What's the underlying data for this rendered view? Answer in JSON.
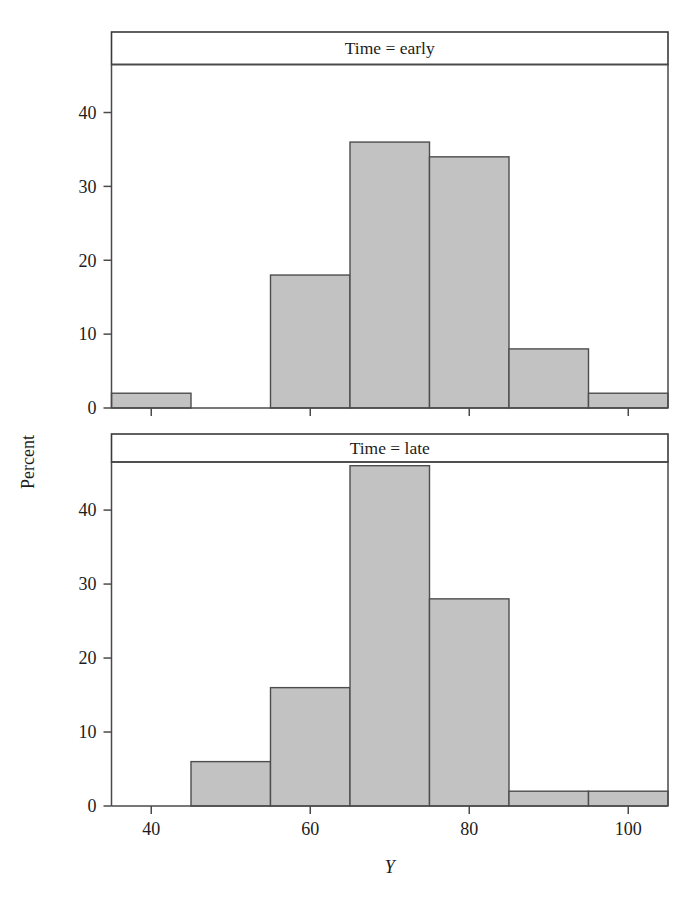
{
  "figure": {
    "width": 691,
    "height": 908,
    "background": "#ffffff",
    "bar_fill": "#c2c2c2",
    "bar_stroke": "#4d4d4d",
    "frame_stroke": "#4a4a4a",
    "text_color": "#1c1c1c"
  },
  "axes": {
    "y_label": "Percent",
    "x_label": "Y",
    "x_label_style": "italic"
  },
  "chart_data": {
    "type": "bar",
    "title": "",
    "xlabel": "Y",
    "ylabel": "Percent",
    "grid": false,
    "legend": "none",
    "layout": "two stacked panels (conditioned on Time)",
    "bin_width": 10,
    "xlim": [
      35,
      105
    ],
    "x_ticks": [
      40,
      60,
      80,
      100
    ],
    "x_tick_labels": [
      "40",
      "60",
      "80",
      "100"
    ],
    "panels": [
      {
        "strip_label": "Time = early",
        "ylim": [
          0,
          46.5
        ],
        "y_ticks": [
          0,
          10,
          20,
          30,
          40
        ],
        "y_tick_labels": [
          "0",
          "10",
          "20",
          "30",
          "40"
        ],
        "bin_starts": [
          35,
          45,
          55,
          65,
          75,
          85,
          95
        ],
        "bin_ends": [
          45,
          55,
          65,
          75,
          85,
          95,
          105
        ],
        "bin_centers": [
          40,
          50,
          60,
          70,
          80,
          90,
          100
        ],
        "values": [
          2,
          0,
          18,
          36,
          34,
          8,
          2
        ]
      },
      {
        "strip_label": "Time = late",
        "ylim": [
          0,
          46.5
        ],
        "y_ticks": [
          0,
          10,
          20,
          30,
          40
        ],
        "y_tick_labels": [
          "0",
          "10",
          "20",
          "30",
          "40"
        ],
        "bin_starts": [
          35,
          45,
          55,
          65,
          75,
          85,
          95
        ],
        "bin_ends": [
          45,
          55,
          65,
          75,
          85,
          95,
          105
        ],
        "bin_centers": [
          40,
          50,
          60,
          70,
          80,
          90,
          100
        ],
        "values": [
          0,
          6,
          16,
          46,
          28,
          2,
          2
        ]
      }
    ]
  }
}
